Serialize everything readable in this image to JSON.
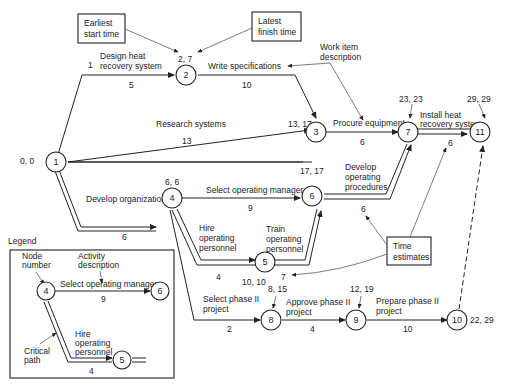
{
  "nodes": [
    {
      "id": "1",
      "times": "0, 0"
    },
    {
      "id": "2",
      "times": "2, 7"
    },
    {
      "id": "3",
      "times": "13, 17"
    },
    {
      "id": "4",
      "times": "6, 6"
    },
    {
      "id": "5",
      "times": "10, 10"
    },
    {
      "id": "6",
      "times": "17, 17"
    },
    {
      "id": "7",
      "times": "23, 23"
    },
    {
      "id": "8",
      "times": "8, 15"
    },
    {
      "id": "9",
      "times": "12, 19"
    },
    {
      "id": "10",
      "times": "22, 29"
    },
    {
      "id": "11",
      "times": "29, 29"
    }
  ],
  "activities": {
    "design_heat": {
      "line1": "Design heat",
      "line2": "recovery system",
      "duration": "5",
      "extra": "1"
    },
    "write_specs": {
      "label": "Write specifications",
      "duration": "10"
    },
    "research": {
      "label": "Research systems",
      "duration": "13"
    },
    "procure": {
      "label": "Procure equipment",
      "duration": "6"
    },
    "install": {
      "line1": "Install heat",
      "line2": "recovery system",
      "duration": "6"
    },
    "develop_org": {
      "label": "Develop organization",
      "duration": "6"
    },
    "select_mgr": {
      "label": "Select operating manager",
      "duration": "9"
    },
    "develop_proc": {
      "line1": "Develop",
      "line2": "operating",
      "line3": "procedures",
      "duration": "6"
    },
    "hire": {
      "line1": "Hire",
      "line2": "operating",
      "line3": "personnel",
      "duration": "4"
    },
    "train": {
      "line1": "Train",
      "line2": "operating",
      "line3": "personnel",
      "duration": "7"
    },
    "select_phase": {
      "line1": "Select phase II",
      "line2": "project",
      "duration": "2"
    },
    "approve_phase": {
      "line1": "Approve phase II",
      "line2": "project",
      "duration": "4"
    },
    "prepare_phase": {
      "line1": "Prepare phase II",
      "line2": "project",
      "duration": "10"
    }
  },
  "callouts": {
    "earliest": {
      "line1": "Earliest",
      "line2": "start time"
    },
    "latest": {
      "line1": "Latest",
      "line2": "finish time"
    },
    "work_item": {
      "line1": "Work item",
      "line2": "description"
    },
    "time_est": {
      "line1": "Time",
      "line2": "estimates"
    }
  },
  "legend": {
    "title": "Legend",
    "node_number": {
      "line1": "Node",
      "line2": "number"
    },
    "activity_desc": {
      "line1": "Activity",
      "line2": "description"
    },
    "critical_path": {
      "line1": "Critical",
      "line2": "path"
    },
    "select_mgr": "Select operating manager",
    "select_dur": "9",
    "hire": {
      "line1": "Hire",
      "line2": "operating",
      "line3": "personnel"
    },
    "hire_dur": "4",
    "node_a": "4",
    "node_b": "6",
    "node_c": "5"
  }
}
